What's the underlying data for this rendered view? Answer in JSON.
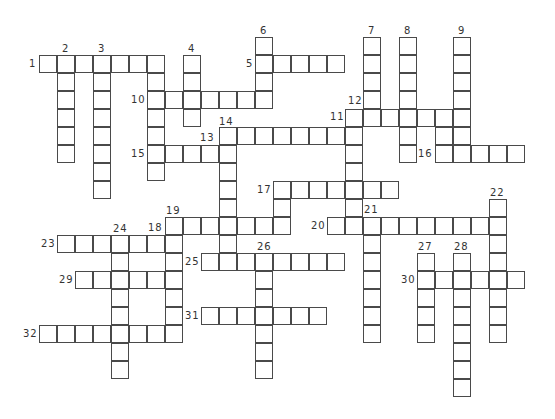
{
  "puzzle": {
    "type": "crossword",
    "grid_origin": {
      "x": 39,
      "y": 37
    },
    "cell_size": 18,
    "border_color": "#4a4a4a",
    "label_color": "#333333",
    "entries": [
      {
        "label": "1",
        "dir": "across",
        "row": 1,
        "col": 0,
        "len": 7
      },
      {
        "label": "2",
        "dir": "down",
        "row": 1,
        "col": 1,
        "len": 6
      },
      {
        "label": "3",
        "dir": "down",
        "row": 1,
        "col": 3,
        "len": 8
      },
      {
        "label": "",
        "dir": "down",
        "row": 1,
        "col": 6,
        "len": 7
      },
      {
        "label": "4",
        "dir": "down",
        "row": 1,
        "col": 8,
        "len": 4
      },
      {
        "label": "5",
        "dir": "across",
        "row": 1,
        "col": 12,
        "len": 5
      },
      {
        "label": "6",
        "dir": "down",
        "row": 0,
        "col": 12,
        "len": 4
      },
      {
        "label": "7",
        "dir": "down",
        "row": 0,
        "col": 18,
        "len": 5
      },
      {
        "label": "8",
        "dir": "down",
        "row": 0,
        "col": 20,
        "len": 7
      },
      {
        "label": "9",
        "dir": "down",
        "row": 0,
        "col": 23,
        "len": 6
      },
      {
        "label": "10",
        "dir": "across",
        "row": 3,
        "col": 6,
        "len": 7
      },
      {
        "label": "11",
        "dir": "across",
        "row": 4,
        "col": 17,
        "len": 7
      },
      {
        "label": "12",
        "dir": "down",
        "row": 4,
        "col": 17,
        "len": 7
      },
      {
        "label": "",
        "dir": "down",
        "row": 4,
        "col": 22,
        "len": 3
      },
      {
        "label": "13",
        "dir": "across",
        "row": 5,
        "col": 10,
        "len": 8
      },
      {
        "label": "14",
        "dir": "down",
        "row": 5,
        "col": 10,
        "len": 8
      },
      {
        "label": "15",
        "dir": "across",
        "row": 6,
        "col": 6,
        "len": 5
      },
      {
        "label": "16",
        "dir": "across",
        "row": 6,
        "col": 22,
        "len": 5
      },
      {
        "label": "17",
        "dir": "across",
        "row": 8,
        "col": 13,
        "len": 7
      },
      {
        "label": "",
        "dir": "down",
        "row": 8,
        "col": 13,
        "len": 3
      },
      {
        "label": "19",
        "dir": "across",
        "row": 10,
        "col": 7,
        "len": 7
      },
      {
        "label": "",
        "dir": "down",
        "row": 10,
        "col": 7,
        "len": 7
      },
      {
        "label": "20",
        "dir": "across",
        "row": 10,
        "col": 16,
        "len": 10
      },
      {
        "label": "21",
        "dir": "down",
        "row": 10,
        "col": 18,
        "len": 7
      },
      {
        "label": "22",
        "dir": "down",
        "row": 9,
        "col": 25,
        "len": 8
      },
      {
        "label": "23",
        "dir": "across",
        "row": 11,
        "col": 1,
        "len": 7
      },
      {
        "label": "24",
        "dir": "down",
        "row": 11,
        "col": 4,
        "len": 8
      },
      {
        "label": "25",
        "dir": "across",
        "row": 12,
        "col": 9,
        "len": 8
      },
      {
        "label": "26",
        "dir": "down",
        "row": 12,
        "col": 12,
        "len": 7
      },
      {
        "label": "27",
        "dir": "down",
        "row": 12,
        "col": 21,
        "len": 5
      },
      {
        "label": "28",
        "dir": "down",
        "row": 12,
        "col": 23,
        "len": 8
      },
      {
        "label": "29",
        "dir": "across",
        "row": 13,
        "col": 2,
        "len": 6
      },
      {
        "label": "30",
        "dir": "across",
        "row": 13,
        "col": 21,
        "len": 6
      },
      {
        "label": "31",
        "dir": "across",
        "row": 15,
        "col": 9,
        "len": 7
      },
      {
        "label": "32",
        "dir": "across",
        "row": 16,
        "col": 0,
        "len": 8
      }
    ],
    "labels": [
      {
        "text": "1",
        "x": 29,
        "y": 59
      },
      {
        "text": "2",
        "x": 62,
        "y": 44
      },
      {
        "text": "3",
        "x": 98,
        "y": 44
      },
      {
        "text": "4",
        "x": 188,
        "y": 44
      },
      {
        "text": "5",
        "x": 246,
        "y": 59
      },
      {
        "text": "6",
        "x": 260,
        "y": 26
      },
      {
        "text": "7",
        "x": 368,
        "y": 26
      },
      {
        "text": "8",
        "x": 404,
        "y": 26
      },
      {
        "text": "9",
        "x": 458,
        "y": 26
      },
      {
        "text": "10",
        "x": 131,
        "y": 95
      },
      {
        "text": "11",
        "x": 330,
        "y": 112
      },
      {
        "text": "12",
        "x": 348,
        "y": 96
      },
      {
        "text": "13",
        "x": 200,
        "y": 133
      },
      {
        "text": "14",
        "x": 219,
        "y": 117
      },
      {
        "text": "15",
        "x": 131,
        "y": 149
      },
      {
        "text": "16",
        "x": 418,
        "y": 149
      },
      {
        "text": "17",
        "x": 257,
        "y": 185
      },
      {
        "text": "18",
        "x": 148,
        "y": 223
      },
      {
        "text": "19",
        "x": 166,
        "y": 206
      },
      {
        "text": "20",
        "x": 311,
        "y": 221
      },
      {
        "text": "21",
        "x": 364,
        "y": 205
      },
      {
        "text": "22",
        "x": 490,
        "y": 188
      },
      {
        "text": "23",
        "x": 41,
        "y": 239
      },
      {
        "text": "24",
        "x": 113,
        "y": 224
      },
      {
        "text": "25",
        "x": 185,
        "y": 257
      },
      {
        "text": "26",
        "x": 257,
        "y": 242
      },
      {
        "text": "27",
        "x": 418,
        "y": 242
      },
      {
        "text": "28",
        "x": 454,
        "y": 242
      },
      {
        "text": "29",
        "x": 59,
        "y": 275
      },
      {
        "text": "30",
        "x": 401,
        "y": 275
      },
      {
        "text": "31",
        "x": 185,
        "y": 311
      },
      {
        "text": "32",
        "x": 23,
        "y": 329
      }
    ]
  }
}
